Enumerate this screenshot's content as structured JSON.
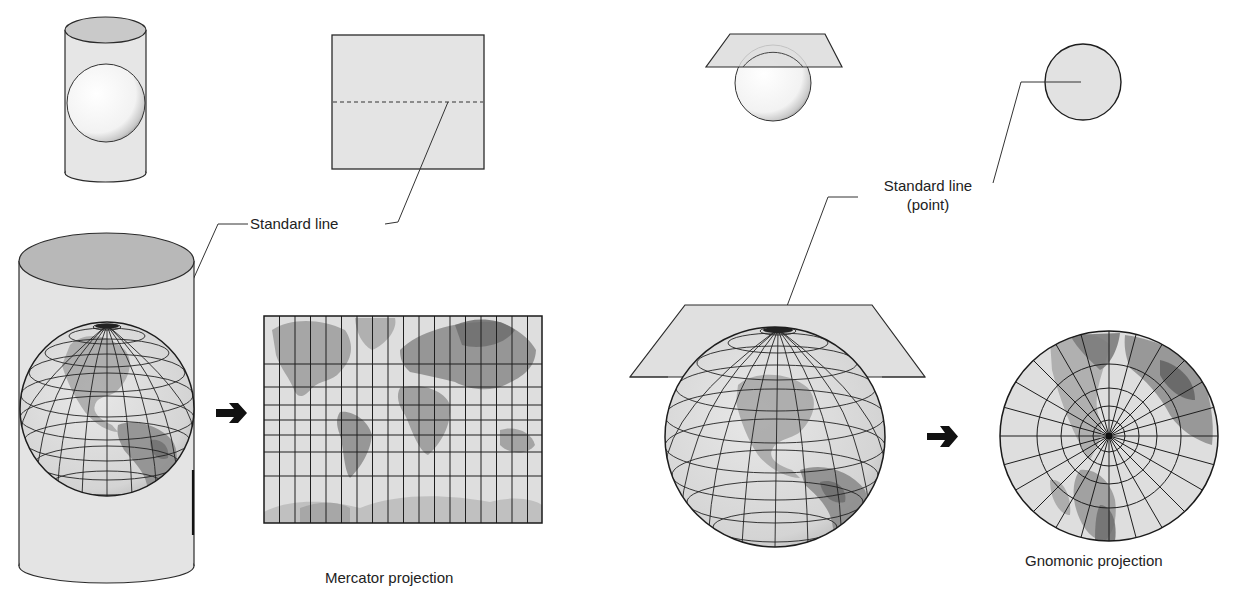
{
  "figure": {
    "panels": [
      {
        "id": "cylindrical",
        "surface": "cylinder",
        "caption": "Mercator projection",
        "standard_line_label": "Standard line"
      },
      {
        "id": "planar",
        "surface": "plane",
        "caption": "Gnomonic projection",
        "standard_line_label_line1": "Standard line",
        "standard_line_label_line2": "(point)"
      }
    ],
    "icons": {
      "arrow_left": "right-arrow",
      "arrow_right": "right-arrow"
    },
    "colors": {
      "fill_light": "#e4e4e4",
      "fill_surface": "#dcdcdc",
      "fill_cap": "#b9b9b9",
      "outline": "#2a2a2a",
      "land": "#9a9a9a",
      "land_dark": "#6f6f6f",
      "graticule": "#222222"
    }
  }
}
